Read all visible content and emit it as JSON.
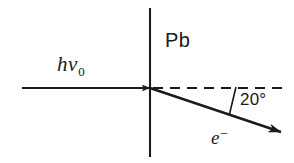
{
  "figure": {
    "background_color": "#ffffff",
    "stroke_color": "#1a1a1a",
    "labels": {
      "photon": {
        "symbol": "hν",
        "subscript": "0"
      },
      "material": "Pb",
      "angle": "20°",
      "electron": {
        "symbol": "e",
        "superscript": "−"
      }
    },
    "geometry": {
      "barrier_line": {
        "x": 150,
        "y_top": 8,
        "y_bottom": 157,
        "label": "Pb barrier"
      },
      "photon_ray": {
        "x_start": 22,
        "y_start": 88,
        "x_end": 150,
        "y_end": 88,
        "arrow": true
      },
      "reference_dashed_line": {
        "x_start": 152,
        "y": 88,
        "x_end": 285,
        "dash": "9 7"
      },
      "electron_ray": {
        "x_start": 150,
        "y_start": 88,
        "x_end": 283,
        "y_end": 133,
        "arrow": true,
        "angle_degrees": 20
      },
      "angle_tick": {
        "x_start": 236,
        "y_start": 87,
        "x_end": 229,
        "y_end": 114
      }
    }
  }
}
